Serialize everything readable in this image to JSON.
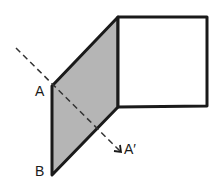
{
  "diagram": {
    "labels": {
      "a": "A",
      "a_prime": "A′",
      "b": "B"
    },
    "colors": {
      "stroke": "#1a1a1a",
      "shaded_face": "#b5b5b5",
      "square_fill": "#ffffff",
      "dashed_line": "#333333"
    },
    "shapes": {
      "square": [
        [
          118,
          17
        ],
        [
          207,
          17
        ],
        [
          207,
          106
        ],
        [
          118,
          107
        ]
      ],
      "parallelogram": [
        [
          52,
          86
        ],
        [
          118,
          17
        ],
        [
          118,
          107
        ],
        [
          52,
          175
        ]
      ],
      "dashed_arrow": {
        "from": [
          16,
          48
        ],
        "to": [
          121,
          152
        ]
      }
    }
  }
}
